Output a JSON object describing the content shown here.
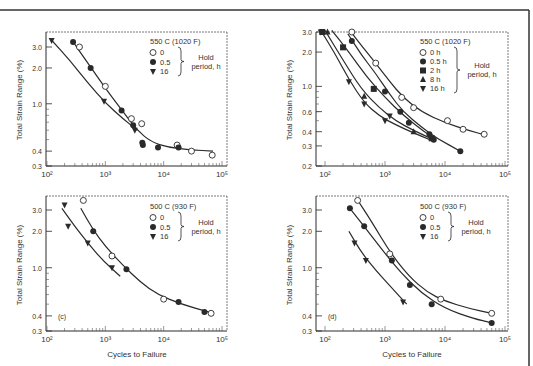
{
  "figure": {
    "background": "#ffffff",
    "ink": "#2a2a2a",
    "frame_top_y": 10,
    "frame_right_x": 529
  },
  "chart_data": [
    {
      "panel": "a",
      "type": "scatter",
      "title": "550 C (1020 F)",
      "panel_label": "",
      "xlabel": "",
      "ylabel": "Total Strain Range (%)",
      "xscale": "log",
      "yscale": "log",
      "xlim": [
        100,
        100000
      ],
      "ylim": [
        0.3,
        4.0
      ],
      "xticks": [
        {
          "v": 100,
          "label": "10²"
        },
        {
          "v": 1000,
          "label": "10³"
        },
        {
          "v": 10000,
          "label": "10⁴"
        },
        {
          "v": 100000,
          "label": "10⁵"
        }
      ],
      "yticks": [
        {
          "v": 3.0,
          "label": "3.0"
        },
        {
          "v": 2.0,
          "label": "2.0"
        },
        {
          "v": 1.0,
          "label": "1.0"
        },
        {
          "v": 0.4,
          "label": "0.4"
        },
        {
          "v": 0.3,
          "label": "0.3"
        }
      ],
      "legend": {
        "header": "Hold period, h",
        "entries": [
          "0",
          "0.5",
          "16"
        ]
      },
      "series": [
        {
          "name": "0",
          "marker": "open-circle",
          "points": [
            [
              360,
              3.0
            ],
            [
              1000,
              1.4
            ],
            [
              2800,
              0.75
            ],
            [
              4200,
              0.68
            ],
            [
              17000,
              0.45
            ],
            [
              30000,
              0.4
            ],
            [
              68000,
              0.37
            ]
          ]
        },
        {
          "name": "0.5",
          "marker": "filled-circle",
          "points": [
            [
              280,
              3.3
            ],
            [
              560,
              2.0
            ],
            [
              1900,
              0.88
            ],
            [
              3000,
              0.66
            ],
            [
              4300,
              0.47
            ],
            [
              4400,
              0.45
            ],
            [
              8000,
              0.43
            ],
            [
              18000,
              0.43
            ]
          ]
        },
        {
          "name": "16",
          "marker": "filled-triangle-down",
          "points": [
            [
              120,
              3.4
            ],
            [
              950,
              1.05
            ],
            [
              3200,
              0.6
            ]
          ]
        }
      ],
      "curves": [
        {
          "name": "fit-0/0.5",
          "points": [
            [
              270,
              3.4
            ],
            [
              500,
              2.2
            ],
            [
              1000,
              1.35
            ],
            [
              2000,
              0.86
            ],
            [
              3500,
              0.6
            ],
            [
              6000,
              0.48
            ],
            [
              12000,
              0.43
            ],
            [
              30000,
              0.41
            ],
            [
              70000,
              0.4
            ]
          ]
        },
        {
          "name": "fit-16",
          "points": [
            [
              115,
              3.5
            ],
            [
              250,
              2.3
            ],
            [
              500,
              1.5
            ],
            [
              1000,
              1.02
            ],
            [
              2000,
              0.75
            ],
            [
              3500,
              0.6
            ]
          ]
        }
      ],
      "frame": {
        "x0": 46,
        "x1": 227,
        "y0": 32,
        "y1": 166
      },
      "map": {
        "xa": 47,
        "xb": 222,
        "ya": 166,
        "yb": 47,
        "ya_val": 0.3,
        "yb_val": 3.0
      },
      "legend_pos": {
        "x": 150,
        "y": 38
      }
    },
    {
      "panel": "b",
      "type": "scatter",
      "title": "550 C (1020 F)",
      "panel_label": "",
      "xlabel": "",
      "ylabel": "Total Strain Range (%)",
      "xscale": "log",
      "yscale": "log",
      "xlim": [
        100,
        100000
      ],
      "ylim": [
        0.2,
        3.0
      ],
      "xticks": [
        {
          "v": 100,
          "label": "10²"
        },
        {
          "v": 1000,
          "label": "10³"
        },
        {
          "v": 10000,
          "label": "10⁴"
        },
        {
          "v": 100000,
          "label": "10⁵"
        }
      ],
      "yticks": [
        {
          "v": 3.0,
          "label": "3.0"
        },
        {
          "v": 2.0,
          "label": "2.0"
        },
        {
          "v": 1.0,
          "label": "1.0"
        },
        {
          "v": 0.6,
          "label": "0.6"
        },
        {
          "v": 0.4,
          "label": "0.4"
        },
        {
          "v": 0.3,
          "label": "0.3"
        },
        {
          "v": 0.2,
          "label": "0.2"
        }
      ],
      "legend": {
        "header": "Hold period, h",
        "entries": [
          "0 h",
          "0.5 h",
          "2 h",
          "8 h",
          "16 h"
        ]
      },
      "series": [
        {
          "name": "0 h",
          "marker": "open-circle",
          "points": [
            [
              280,
              3.0
            ],
            [
              700,
              1.6
            ],
            [
              1900,
              0.8
            ],
            [
              3000,
              0.65
            ],
            [
              11000,
              0.5
            ],
            [
              20000,
              0.42
            ],
            [
              45000,
              0.38
            ]
          ]
        },
        {
          "name": "0.5 h",
          "marker": "filled-circle",
          "points": [
            [
              280,
              2.5
            ],
            [
              1000,
              0.9
            ],
            [
              1800,
              0.6
            ],
            [
              2500,
              0.48
            ],
            [
              5500,
              0.38
            ],
            [
              6500,
              0.34
            ],
            [
              18000,
              0.27
            ]
          ]
        },
        {
          "name": "2 h",
          "marker": "filled-square",
          "points": [
            [
              90,
              3.0
            ],
            [
              200,
              2.2
            ],
            [
              650,
              0.95
            ],
            [
              6000,
              0.35
            ]
          ]
        },
        {
          "name": "8 h",
          "marker": "filled-triangle-up",
          "points": [
            [
              110,
              3.0
            ],
            [
              450,
              0.82
            ],
            [
              3000,
              0.4
            ]
          ]
        },
        {
          "name": "16 h",
          "marker": "filled-triangle-down",
          "points": [
            [
              85,
              3.0
            ],
            [
              250,
              1.1
            ],
            [
              450,
              0.7
            ],
            [
              1000,
              0.5
            ],
            [
              1200,
              0.55
            ]
          ]
        }
      ],
      "curves": [
        {
          "name": "fit-0h",
          "points": [
            [
              260,
              3.1
            ],
            [
              400,
              2.3
            ],
            [
              700,
              1.6
            ],
            [
              1200,
              1.1
            ],
            [
              2000,
              0.8
            ],
            [
              4000,
              0.6
            ],
            [
              10000,
              0.48
            ],
            [
              25000,
              0.41
            ],
            [
              50000,
              0.37
            ]
          ]
        },
        {
          "name": "fit-0.5h",
          "points": [
            [
              240,
              2.9
            ],
            [
              400,
              1.9
            ],
            [
              700,
              1.3
            ],
            [
              1200,
              0.85
            ],
            [
              2000,
              0.6
            ],
            [
              4000,
              0.44
            ],
            [
              8000,
              0.34
            ],
            [
              18000,
              0.27
            ]
          ]
        },
        {
          "name": "fit-2h",
          "points": [
            [
              130,
              3.1
            ],
            [
              250,
              2.0
            ],
            [
              500,
              1.2
            ],
            [
              1000,
              0.8
            ],
            [
              2000,
              0.56
            ],
            [
              4000,
              0.42
            ],
            [
              6500,
              0.35
            ]
          ]
        },
        {
          "name": "fit-8h",
          "points": [
            [
              100,
              3.1
            ],
            [
              200,
              1.7
            ],
            [
              400,
              0.95
            ],
            [
              800,
              0.65
            ],
            [
              1500,
              0.5
            ],
            [
              3000,
              0.41
            ],
            [
              6500,
              0.34
            ]
          ]
        },
        {
          "name": "fit-16h",
          "points": [
            [
              85,
              3.1
            ],
            [
              150,
              1.9
            ],
            [
              250,
              1.15
            ],
            [
              450,
              0.72
            ],
            [
              800,
              0.55
            ],
            [
              1500,
              0.46
            ],
            [
              3000,
              0.39
            ],
            [
              6500,
              0.33
            ]
          ]
        }
      ],
      "frame": {
        "x0": 316,
        "x1": 508,
        "y0": 32,
        "y1": 166
      },
      "map": {
        "xa": 325,
        "xb": 505,
        "ya": 166,
        "yb": 32,
        "ya_val": 0.2,
        "yb_val": 3.0
      },
      "legend_pos": {
        "x": 420,
        "y": 38
      }
    },
    {
      "panel": "c",
      "type": "scatter",
      "title": "500 C (930 F)",
      "panel_label": "(c)",
      "xlabel": "Cycles to Failure",
      "ylabel": "Total Strain Range (%)",
      "xscale": "log",
      "yscale": "log",
      "xlim": [
        100,
        100000
      ],
      "ylim": [
        0.3,
        4.0
      ],
      "xticks": [
        {
          "v": 100,
          "label": "10²"
        },
        {
          "v": 1000,
          "label": "10³"
        },
        {
          "v": 10000,
          "label": "10⁴"
        },
        {
          "v": 100000,
          "label": "10⁵"
        }
      ],
      "yticks": [
        {
          "v": 3.0,
          "label": "3.0"
        },
        {
          "v": 2.0,
          "label": "2.0"
        },
        {
          "v": 1.0,
          "label": "1.0"
        },
        {
          "v": 0.4,
          "label": "0.4"
        },
        {
          "v": 0.3,
          "label": "0.3"
        }
      ],
      "legend": {
        "header": "Hold period, h",
        "entries": [
          "0",
          "0.5",
          "16"
        ]
      },
      "series": [
        {
          "name": "0",
          "marker": "open-circle",
          "points": [
            [
              420,
              3.6
            ],
            [
              1300,
              1.25
            ],
            [
              10000,
              0.55
            ],
            [
              65000,
              0.42
            ]
          ]
        },
        {
          "name": "0.5",
          "marker": "filled-circle",
          "points": [
            [
              620,
              2.0
            ],
            [
              2300,
              0.97
            ],
            [
              18000,
              0.52
            ],
            [
              50000,
              0.43
            ]
          ]
        },
        {
          "name": "16",
          "marker": "filled-triangle-down",
          "points": [
            [
              200,
              3.3
            ],
            [
              230,
              2.2
            ],
            [
              500,
              1.6
            ],
            [
              1300,
              1.0
            ]
          ]
        }
      ],
      "curves": [
        {
          "name": "fit-0/0.5",
          "points": [
            [
              380,
              3.1
            ],
            [
              600,
              2.1
            ],
            [
              1000,
              1.5
            ],
            [
              2000,
              1.05
            ],
            [
              4000,
              0.76
            ],
            [
              8000,
              0.6
            ],
            [
              20000,
              0.5
            ],
            [
              60000,
              0.43
            ]
          ]
        },
        {
          "name": "fit-16",
          "points": [
            [
              180,
              3.1
            ],
            [
              300,
              2.2
            ],
            [
              500,
              1.6
            ],
            [
              900,
              1.15
            ],
            [
              1800,
              0.85
            ]
          ]
        }
      ],
      "frame": {
        "x0": 46,
        "x1": 227,
        "y0": 196,
        "y1": 331
      },
      "map": {
        "xa": 47,
        "xb": 222,
        "ya": 331,
        "yb": 210,
        "ya_val": 0.3,
        "yb_val": 3.0
      },
      "legend_pos": {
        "x": 150,
        "y": 203
      }
    },
    {
      "panel": "d",
      "type": "scatter",
      "title": "500 C (930 F)",
      "panel_label": "(d)",
      "xlabel": "Cycles to Failure",
      "ylabel": "Total Strain Range (%)",
      "xscale": "log",
      "yscale": "log",
      "xlim": [
        100,
        100000
      ],
      "ylim": [
        0.3,
        4.0
      ],
      "xticks": [
        {
          "v": 100,
          "label": "10²"
        },
        {
          "v": 1000,
          "label": "10³"
        },
        {
          "v": 10000,
          "label": "10⁴"
        },
        {
          "v": 100000,
          "label": "10⁵"
        }
      ],
      "yticks": [
        {
          "v": 3.0,
          "label": "3.0"
        },
        {
          "v": 2.0,
          "label": "2.0"
        },
        {
          "v": 1.0,
          "label": "1.0"
        },
        {
          "v": 0.4,
          "label": "0.4"
        },
        {
          "v": 0.3,
          "label": "0.3"
        }
      ],
      "legend": {
        "header": "Hold period, h",
        "entries": [
          "0",
          "0.5",
          "16"
        ]
      },
      "series": [
        {
          "name": "0",
          "marker": "open-circle",
          "points": [
            [
              350,
              3.6
            ],
            [
              1200,
              1.3
            ],
            [
              8500,
              0.55
            ],
            [
              60000,
              0.42
            ]
          ]
        },
        {
          "name": "0.5",
          "marker": "filled-circle",
          "points": [
            [
              260,
              3.1
            ],
            [
              450,
              2.2
            ],
            [
              1300,
              1.15
            ],
            [
              2600,
              0.72
            ],
            [
              6000,
              0.5
            ],
            [
              60000,
              0.35
            ]
          ]
        },
        {
          "name": "16",
          "marker": "filled-triangle-down",
          "points": [
            [
              310,
              1.6
            ],
            [
              480,
              1.15
            ],
            [
              2000,
              0.52
            ]
          ]
        }
      ],
      "curves": [
        {
          "name": "fit-0",
          "points": [
            [
              340,
              3.7
            ],
            [
              600,
              2.4
            ],
            [
              1200,
              1.35
            ],
            [
              2500,
              0.85
            ],
            [
              5000,
              0.63
            ],
            [
              10000,
              0.53
            ],
            [
              25000,
              0.46
            ],
            [
              60000,
              0.42
            ]
          ]
        },
        {
          "name": "fit-0.5",
          "points": [
            [
              260,
              3.1
            ],
            [
              450,
              2.2
            ],
            [
              900,
              1.4
            ],
            [
              1800,
              0.92
            ],
            [
              4000,
              0.62
            ],
            [
              10000,
              0.46
            ],
            [
              30000,
              0.38
            ],
            [
              60000,
              0.35
            ]
          ]
        },
        {
          "name": "fit-16",
          "points": [
            [
              250,
              2.0
            ],
            [
              400,
              1.35
            ],
            [
              700,
              0.95
            ],
            [
              1300,
              0.68
            ],
            [
              2300,
              0.5
            ]
          ]
        }
      ],
      "frame": {
        "x0": 316,
        "x1": 508,
        "y0": 196,
        "y1": 331
      },
      "map": {
        "xa": 325,
        "xb": 505,
        "ya": 331,
        "yb": 210,
        "ya_val": 0.3,
        "yb_val": 3.0
      },
      "legend_pos": {
        "x": 420,
        "y": 203
      }
    }
  ],
  "labels": {
    "ylabel_top": "Total Strain Range (%)",
    "ylabel_right_top": "Total Strain Range (%)",
    "xlabel_left": "Cycles to Failure",
    "xlabel_right": "Cycles to Failure",
    "hold_line1": "Hold",
    "hold_line2": "period, h"
  }
}
